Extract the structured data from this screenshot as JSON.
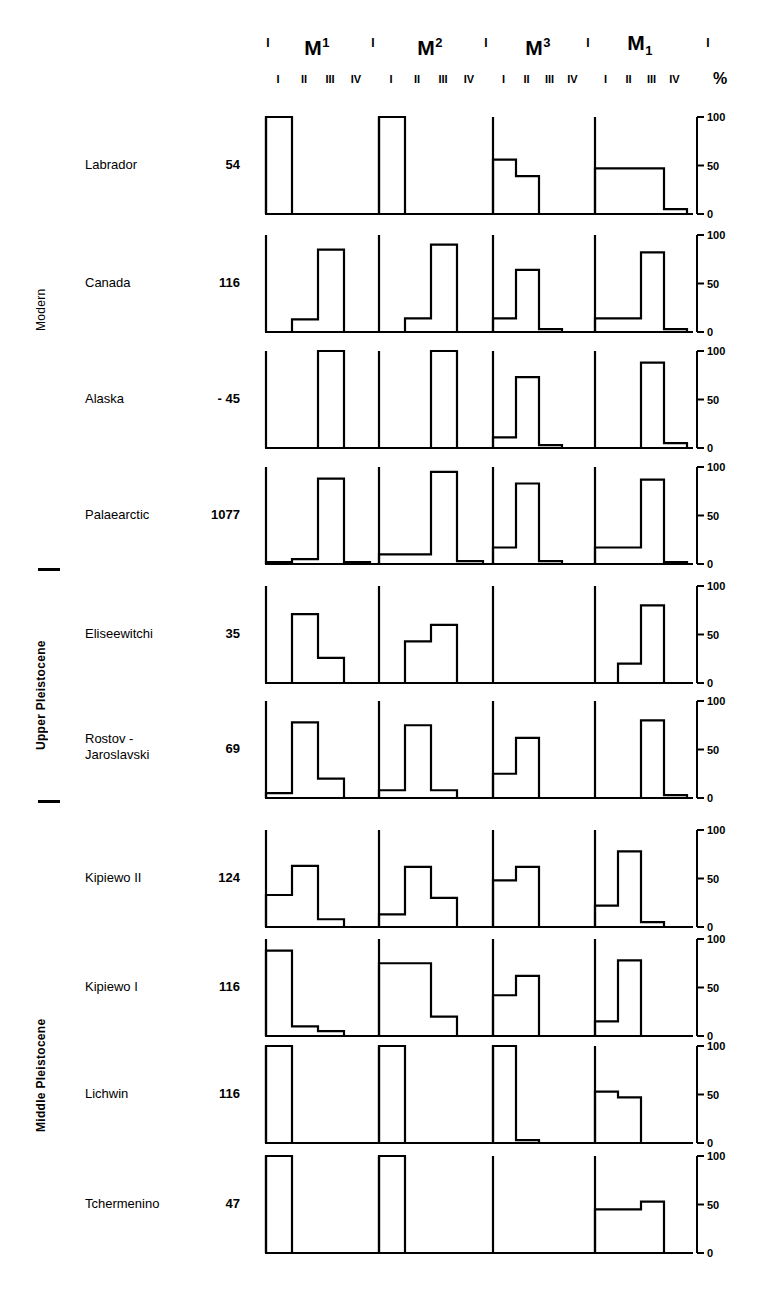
{
  "header": {
    "teeth": [
      {
        "letter": "M",
        "sup": "1",
        "sub": ""
      },
      {
        "letter": "M",
        "sup": "2",
        "sub": ""
      },
      {
        "letter": "M",
        "sup": "3",
        "sub": ""
      },
      {
        "letter": "M",
        "sup": "",
        "sub": "1"
      }
    ],
    "separator_tick": "I",
    "stage_ticks": [
      "I",
      "II",
      "III",
      "IV"
    ],
    "percent_symbol": "%"
  },
  "axis": {
    "ticks": [
      "100",
      "50",
      "0"
    ],
    "values": [
      100,
      50,
      0
    ],
    "max": 100,
    "min": 0
  },
  "eras": [
    {
      "name": "Modern",
      "rows": [
        0,
        1,
        2,
        3
      ]
    },
    {
      "name": "Upper Pleistocene",
      "rows": [
        4,
        5
      ]
    },
    {
      "name": "Middle Pleistocene",
      "rows": [
        6,
        7,
        8,
        9
      ]
    }
  ],
  "rows": [
    {
      "name": "Labrador",
      "count": "54"
    },
    {
      "name": "Canada",
      "count": "116"
    },
    {
      "name": "Alaska",
      "count": "- 45"
    },
    {
      "name": "Palaearctic",
      "count": "1077"
    },
    {
      "name": "Eliseewitchi",
      "count": "35"
    },
    {
      "name": "Rostov -\nJaroslavski",
      "count": "69"
    },
    {
      "name": "Kipiewo II",
      "count": "124"
    },
    {
      "name": "Kipiewo I",
      "count": "116"
    },
    {
      "name": "Lichwin",
      "count": "116"
    },
    {
      "name": "Tchermenino",
      "count": "47"
    }
  ],
  "chart_data": {
    "type": "bar",
    "title": "",
    "xlabel": "",
    "ylabel": "%",
    "ylim": [
      0,
      100
    ],
    "grid": false,
    "legend": "none",
    "categories": [
      "M1 I",
      "M1 II",
      "M1 III",
      "M1 IV",
      "M2 I",
      "M2 II",
      "M2 III",
      "M2 IV",
      "M3 I",
      "M3 II",
      "M3 III",
      "M3 IV",
      "M1low I",
      "M1low II",
      "M1low III",
      "M1low IV"
    ],
    "teeth": [
      "M1",
      "M2",
      "M3",
      "M1 lower"
    ],
    "stages": [
      "I",
      "II",
      "III",
      "IV"
    ],
    "series": [
      {
        "name": "Labrador",
        "values": [
          100,
          0,
          0,
          0,
          100,
          0,
          0,
          0,
          56,
          39,
          0,
          0,
          47,
          47,
          47,
          5
        ]
      },
      {
        "name": "Canada",
        "values": [
          0,
          13,
          85,
          0,
          0,
          14,
          90,
          0,
          14,
          64,
          3,
          0,
          14,
          14,
          82,
          3
        ]
      },
      {
        "name": "Alaska",
        "values": [
          0,
          0,
          100,
          0,
          0,
          0,
          100,
          0,
          11,
          73,
          3,
          0,
          0,
          0,
          88,
          5
        ]
      },
      {
        "name": "Palaearctic",
        "values": [
          2,
          5,
          88,
          2,
          10,
          10,
          95,
          3,
          17,
          83,
          3,
          0,
          17,
          17,
          87,
          2
        ]
      },
      {
        "name": "Eliseewitchi",
        "values": [
          0,
          71,
          26,
          0,
          0,
          43,
          60,
          0,
          0,
          0,
          0,
          0,
          0,
          20,
          80,
          0
        ]
      },
      {
        "name": "Rostov - Jaroslavski",
        "values": [
          5,
          78,
          20,
          0,
          8,
          75,
          8,
          0,
          25,
          62,
          0,
          0,
          0,
          0,
          80,
          3
        ]
      },
      {
        "name": "Kipiewo II",
        "values": [
          33,
          63,
          8,
          0,
          13,
          62,
          30,
          0,
          48,
          62,
          0,
          0,
          22,
          78,
          5,
          0
        ]
      },
      {
        "name": "Kipiewo I",
        "values": [
          88,
          10,
          5,
          0,
          75,
          75,
          20,
          0,
          42,
          62,
          0,
          0,
          15,
          78,
          0,
          0
        ]
      },
      {
        "name": "Lichwin",
        "values": [
          100,
          0,
          0,
          0,
          100,
          0,
          0,
          0,
          100,
          3,
          0,
          0,
          53,
          47,
          0,
          0
        ]
      },
      {
        "name": "Tchermenino",
        "values": [
          100,
          0,
          0,
          0,
          100,
          0,
          0,
          0,
          0,
          0,
          0,
          0,
          45,
          45,
          53,
          0
        ]
      }
    ]
  }
}
